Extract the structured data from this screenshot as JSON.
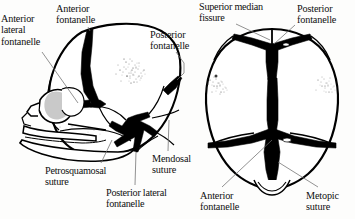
{
  "figure": {
    "background_color": "#fdfdfc",
    "ink_color": "#000000",
    "leader_line_color": "#6e6e6e",
    "views": [
      {
        "name": "lateral-view",
        "position": "left"
      },
      {
        "name": "superior-vertex-view",
        "position": "right"
      }
    ]
  },
  "labels": {
    "anterior_lateral_fontanelle": "Anterior\nlateral\nfontanelle",
    "anterior_fontanelle_left": "Anterior\nfontanelle",
    "posterior_fontanelle_left": "Posterior\nfontanelle",
    "petrosquamosal_suture": "Petrosquamosal\nsuture",
    "posterior_lateral_fontanelle": "Posterior lateral\nfontanelle",
    "mendosal_suture": "Mendosal\nsuture",
    "superior_median_fissure": "Superior median\nfissure",
    "posterior_fontanelle_right": "Posterior\nfontanelle",
    "anterior_fontanelle_right": "Anterior\nfontanelle",
    "metopic_suture": "Metopic\nsuture"
  }
}
